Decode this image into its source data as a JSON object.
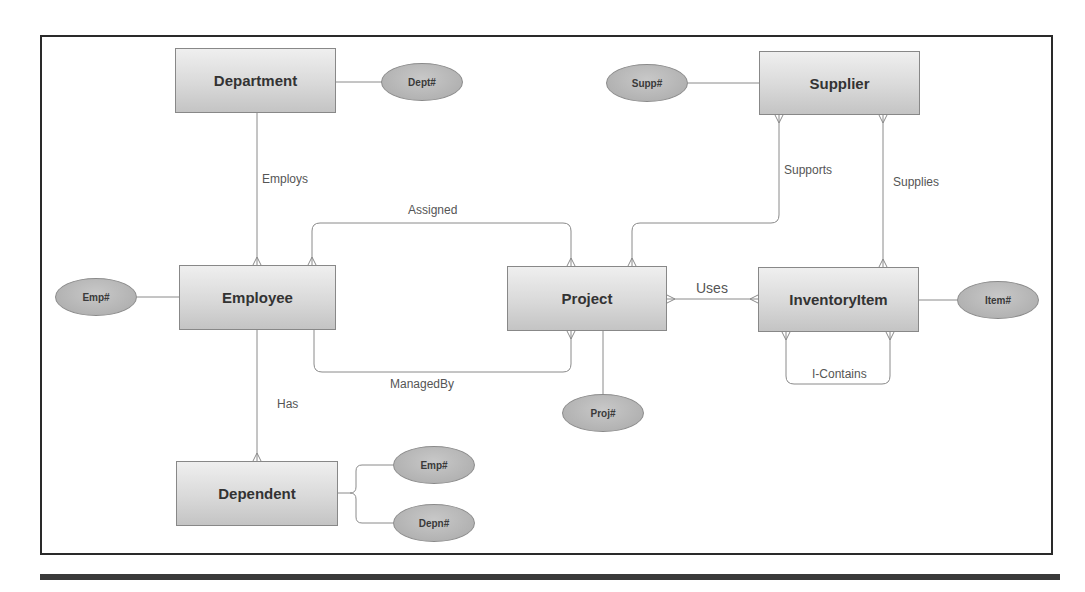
{
  "diagram": {
    "type": "ER diagram (crow's foot)",
    "entities": [
      {
        "id": "department",
        "label": "Department"
      },
      {
        "id": "employee",
        "label": "Employee"
      },
      {
        "id": "dependent",
        "label": "Dependent"
      },
      {
        "id": "project",
        "label": "Project"
      },
      {
        "id": "supplier",
        "label": "Supplier"
      },
      {
        "id": "inventoryitem",
        "label": "InventoryItem"
      }
    ],
    "attributes": [
      {
        "id": "dept-key",
        "label": "Dept#",
        "entity": "Department"
      },
      {
        "id": "emp-key",
        "label": "Emp#",
        "entity": "Employee"
      },
      {
        "id": "dep-emp-key",
        "label": "Emp#",
        "entity": "Dependent"
      },
      {
        "id": "depn-key",
        "label": "Depn#",
        "entity": "Dependent"
      },
      {
        "id": "proj-key",
        "label": "Proj#",
        "entity": "Project"
      },
      {
        "id": "supp-key",
        "label": "Supp#",
        "entity": "Supplier"
      },
      {
        "id": "item-key",
        "label": "Item#",
        "entity": "InventoryItem"
      }
    ],
    "relationships": [
      {
        "label": "Employs",
        "from": "Department",
        "to": "Employee",
        "cardinality": "1:N"
      },
      {
        "label": "Has",
        "from": "Employee",
        "to": "Dependent",
        "cardinality": "1:N"
      },
      {
        "label": "Assigned",
        "from": "Employee",
        "to": "Project",
        "cardinality": "M:N"
      },
      {
        "label": "ManagedBy",
        "from": "Employee",
        "to": "Project",
        "cardinality": "1:N"
      },
      {
        "label": "Supports",
        "from": "Supplier",
        "to": "Project",
        "cardinality": "M:N"
      },
      {
        "label": "Supplies",
        "from": "Supplier",
        "to": "InventoryItem",
        "cardinality": "M:N"
      },
      {
        "label": "Uses",
        "from": "Project",
        "to": "InventoryItem",
        "cardinality": "M:N"
      },
      {
        "label": "I-Contains",
        "from": "InventoryItem",
        "to": "InventoryItem",
        "cardinality": "M:N"
      }
    ]
  },
  "colors": {
    "frame": "#2a2a2a",
    "line": "#8a8a8a",
    "entity_fill_top": "#efefef",
    "entity_fill_bottom": "#c4c4c4",
    "attribute_fill": "#b5b5b5",
    "text": "#333333"
  }
}
